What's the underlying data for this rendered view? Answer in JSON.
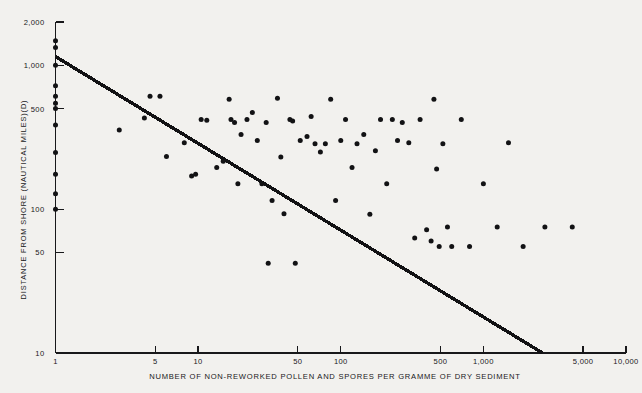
{
  "chart_data": {
    "type": "scatter",
    "title": "",
    "xlabel": "NUMBER OF  NON-REWORKED POLLEN AND SPORES PER GRAMME OF DRY SEDIMENT",
    "ylabel": "DISTANCE FROM SHORE (NAUTICAL MILES)(D)",
    "xscale": "log",
    "yscale": "log",
    "xlim": [
      1,
      10000
    ],
    "ylim": [
      10,
      2000
    ],
    "grid": false,
    "legend": null,
    "xticks": [
      {
        "value": 1,
        "label": "1"
      },
      {
        "value": 5,
        "label": "5"
      },
      {
        "value": 10,
        "label": "10"
      },
      {
        "value": 50,
        "label": "50"
      },
      {
        "value": 100,
        "label": "100"
      },
      {
        "value": 500,
        "label": "500"
      },
      {
        "value": 1000,
        "label": "1,000"
      },
      {
        "value": 5000,
        "label": "5,000"
      },
      {
        "value": 10000,
        "label": "10,000"
      }
    ],
    "yticks": [
      {
        "value": 2000,
        "label": "2,000"
      },
      {
        "value": 1000,
        "label": "1,000"
      },
      {
        "value": 500,
        "label": "500"
      },
      {
        "value": 100,
        "label": "100"
      },
      {
        "value": 50,
        "label": "50"
      },
      {
        "value": 10,
        "label": "10"
      }
    ],
    "marker": {
      "shape": "circle",
      "size": 4.6,
      "color": "#121214"
    },
    "trendline": {
      "type": "line",
      "color": "#121214",
      "width": 3.4,
      "x_start": 1,
      "y_start": 1150,
      "x_end": 2600,
      "y_end": 10
    },
    "points": [
      {
        "x": 1,
        "y": 1480
      },
      {
        "x": 1,
        "y": 1330
      },
      {
        "x": 1,
        "y": 1000
      },
      {
        "x": 1,
        "y": 720
      },
      {
        "x": 1,
        "y": 610
      },
      {
        "x": 1,
        "y": 545
      },
      {
        "x": 1,
        "y": 500
      },
      {
        "x": 1,
        "y": 385
      },
      {
        "x": 1,
        "y": 248
      },
      {
        "x": 1,
        "y": 175
      },
      {
        "x": 1,
        "y": 128
      },
      {
        "x": 1,
        "y": 100
      },
      {
        "x": 2.8,
        "y": 355
      },
      {
        "x": 4.2,
        "y": 430
      },
      {
        "x": 4.6,
        "y": 610
      },
      {
        "x": 5.4,
        "y": 610
      },
      {
        "x": 6.0,
        "y": 232
      },
      {
        "x": 8.0,
        "y": 290
      },
      {
        "x": 9.0,
        "y": 170
      },
      {
        "x": 9.6,
        "y": 175
      },
      {
        "x": 10.5,
        "y": 420
      },
      {
        "x": 11.5,
        "y": 415
      },
      {
        "x": 13.5,
        "y": 195
      },
      {
        "x": 15.0,
        "y": 215
      },
      {
        "x": 16.5,
        "y": 580
      },
      {
        "x": 17.0,
        "y": 420
      },
      {
        "x": 18.0,
        "y": 400
      },
      {
        "x": 19.0,
        "y": 150
      },
      {
        "x": 20.0,
        "y": 330
      },
      {
        "x": 22.0,
        "y": 420
      },
      {
        "x": 24.0,
        "y": 470
      },
      {
        "x": 26.0,
        "y": 300
      },
      {
        "x": 28.0,
        "y": 150
      },
      {
        "x": 30.0,
        "y": 400
      },
      {
        "x": 31.0,
        "y": 42
      },
      {
        "x": 33.0,
        "y": 115
      },
      {
        "x": 36.0,
        "y": 590
      },
      {
        "x": 38.0,
        "y": 230
      },
      {
        "x": 40.0,
        "y": 93
      },
      {
        "x": 44.0,
        "y": 420
      },
      {
        "x": 46.0,
        "y": 410
      },
      {
        "x": 48.0,
        "y": 42
      },
      {
        "x": 52.0,
        "y": 300
      },
      {
        "x": 58.0,
        "y": 320
      },
      {
        "x": 62.0,
        "y": 440
      },
      {
        "x": 66.0,
        "y": 285
      },
      {
        "x": 72.0,
        "y": 250
      },
      {
        "x": 78.0,
        "y": 285
      },
      {
        "x": 85.0,
        "y": 580
      },
      {
        "x": 92.0,
        "y": 115
      },
      {
        "x": 100.0,
        "y": 300
      },
      {
        "x": 108.0,
        "y": 420
      },
      {
        "x": 120.0,
        "y": 195
      },
      {
        "x": 130.0,
        "y": 285
      },
      {
        "x": 145.0,
        "y": 330
      },
      {
        "x": 160.0,
        "y": 92
      },
      {
        "x": 175.0,
        "y": 255
      },
      {
        "x": 190.0,
        "y": 420
      },
      {
        "x": 210.0,
        "y": 150
      },
      {
        "x": 230.0,
        "y": 420
      },
      {
        "x": 250.0,
        "y": 300
      },
      {
        "x": 270.0,
        "y": 400
      },
      {
        "x": 300.0,
        "y": 290
      },
      {
        "x": 330.0,
        "y": 63
      },
      {
        "x": 360.0,
        "y": 420
      },
      {
        "x": 400.0,
        "y": 72
      },
      {
        "x": 430.0,
        "y": 60
      },
      {
        "x": 450.0,
        "y": 580
      },
      {
        "x": 470.0,
        "y": 190
      },
      {
        "x": 490.0,
        "y": 55
      },
      {
        "x": 520.0,
        "y": 285
      },
      {
        "x": 560.0,
        "y": 75
      },
      {
        "x": 600.0,
        "y": 55
      },
      {
        "x": 700.0,
        "y": 420
      },
      {
        "x": 800.0,
        "y": 55
      },
      {
        "x": 1000.0,
        "y": 150
      },
      {
        "x": 1250.0,
        "y": 75
      },
      {
        "x": 1500.0,
        "y": 290
      },
      {
        "x": 1900.0,
        "y": 55
      },
      {
        "x": 2700.0,
        "y": 75
      },
      {
        "x": 4200.0,
        "y": 75
      }
    ]
  }
}
